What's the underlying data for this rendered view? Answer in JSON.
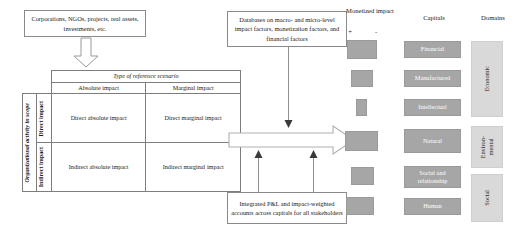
{
  "diagram": {
    "colors": {
      "bar_fill": "#a6a6a6",
      "capital_fill": "#a6a6a6",
      "capital_text": "#ffffff",
      "domain_fill": "#d9d9d9",
      "box_border": "#8a8a8a",
      "connector": "#8f8f8f"
    },
    "boxes": {
      "entities": "Corporations, NGOs, projects, real assets, investments, etc.",
      "databases": "Databases on macro- and micro-level impact factors, monetization factors, and financial factors",
      "integrated": "Integrated P&L and impact-weighted accounts across capitals for all stakeholders"
    },
    "matrix": {
      "top_header": "Type of reference scenario",
      "column_headers": [
        "Absolute impact",
        "Marginal impact"
      ],
      "row_group_label": "Organizational activity in scope",
      "row_headers": [
        "Direct impact",
        "Indirect impact"
      ],
      "cells": [
        [
          "Direct absolute impact",
          "Direct marginal impact"
        ],
        [
          "Indirect absolute impact",
          "Indirect marginal impact"
        ]
      ]
    },
    "columns": {
      "monetized_impact": "Monetized impact",
      "capitals": "Capitals",
      "domains": "Domains"
    },
    "signs": {
      "positive": "+",
      "negative": "-"
    },
    "capitals": [
      {
        "label": "Financial"
      },
      {
        "label": "Manufactured"
      },
      {
        "label": "Intellectual"
      },
      {
        "label": "Natural"
      },
      {
        "label": "Social and relationship"
      },
      {
        "label": "Human"
      }
    ],
    "monetized_bars": [
      {
        "for": "Financial",
        "left": 2,
        "width": 30
      },
      {
        "for": "Manufactured",
        "left": 6,
        "width": 22
      },
      {
        "for": "Intellectual",
        "left": 11,
        "width": 11
      },
      {
        "for": "Natural",
        "left": 0,
        "width": 33
      },
      {
        "for": "Social and relationship",
        "left": 6,
        "width": 23
      },
      {
        "for": "Human",
        "left": 1,
        "width": 28
      }
    ],
    "domains": [
      {
        "label": "Economic",
        "capitals": [
          "Financial",
          "Manufactured",
          "Intellectual"
        ]
      },
      {
        "label": "Environ-\nmental",
        "capitals": [
          "Natural"
        ]
      },
      {
        "label": "Social",
        "capitals": [
          "Social and relationship",
          "Human"
        ]
      }
    ]
  }
}
